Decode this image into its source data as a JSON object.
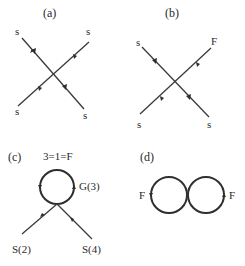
{
  "panels": {
    "a": {
      "label": "(a)",
      "legs": {
        "top_left": "s",
        "top_right": "s",
        "bottom_left": "s",
        "bottom_right": "s"
      }
    },
    "b": {
      "label": "(b)",
      "legs": {
        "top_left": "s",
        "top_right": "F",
        "bottom_left": "s",
        "bottom_right": "s"
      }
    },
    "c": {
      "label": "(c)",
      "loop_label": "3=1=F",
      "loop_side_label": "G(3)",
      "legs": {
        "bottom_left": "S(2)",
        "bottom_right": "S(4)"
      }
    },
    "d": {
      "label": "(d)",
      "loops": {
        "left": "F",
        "right": "F"
      }
    }
  },
  "colors": {
    "line": "#3a3a3a",
    "text": "#2a2a2a",
    "background": "#ffffff"
  }
}
